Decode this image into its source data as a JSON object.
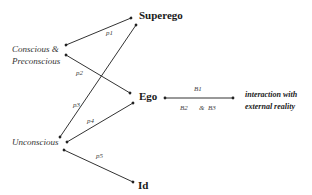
{
  "nodes": {
    "superego": "Superego",
    "ego": "Ego",
    "id": "Id",
    "conscious_line1": "Conscious &",
    "conscious_line2": "Preconscious",
    "unconscious": "Unconscious",
    "external_line1": "interaction with",
    "external_line2": "external reality"
  },
  "edges": {
    "p1": "p1",
    "p2": "p2",
    "p3": "p3",
    "p4": "p4",
    "p5": "p5",
    "b1": "B1",
    "b2": "B2",
    "amp": "&",
    "b3": "B3"
  },
  "colors": {
    "line": "#333333",
    "text": "#1a1a1a",
    "background": "#ffffff"
  }
}
